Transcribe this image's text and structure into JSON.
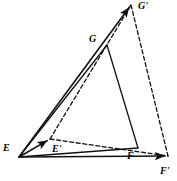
{
  "figure": {
    "background_color": "#ffffff",
    "stroke_color": "#111111",
    "width": 177,
    "height": 181
  },
  "points": {
    "E": {
      "label": "E",
      "x": 19,
      "y": 157,
      "label_x": 3,
      "label_y": 143
    },
    "E_prime": {
      "label": "E'",
      "x": 50,
      "y": 139,
      "label_x": 52,
      "label_y": 144
    },
    "F": {
      "label": "F",
      "x": 138,
      "y": 148,
      "label_x": 127,
      "label_y": 151
    },
    "F_prime": {
      "label": "F'",
      "x": 168,
      "y": 156,
      "label_x": 160,
      "label_y": 166
    },
    "G": {
      "label": "G",
      "x": 107,
      "y": 45,
      "label_x": 89,
      "label_y": 34
    },
    "G_prime": {
      "label": "G'",
      "x": 131,
      "y": 5,
      "label_x": 138,
      "label_y": 1
    }
  },
  "solid_edges": [
    {
      "name": "edge-E-G",
      "from": "E",
      "to": "G"
    },
    {
      "name": "edge-G-F",
      "from": "G",
      "to": "F"
    },
    {
      "name": "edge-E-F",
      "from": "E",
      "to": "F"
    }
  ],
  "dashed_edges": [
    {
      "name": "edge-Eprime-Gprime",
      "from": "E_prime",
      "to": "G_prime"
    },
    {
      "name": "edge-Gprime-Fprime",
      "from": "G_prime",
      "to": "F_prime"
    },
    {
      "name": "edge-Eprime-Fprime",
      "from": "E_prime",
      "to": "F_prime"
    }
  ],
  "vectors": [
    {
      "name": "vector-E-to-Eprime",
      "from": "E",
      "to": "E_prime",
      "style": "solid",
      "arrow": true
    },
    {
      "name": "vector-E-to-Gprime",
      "from": "E",
      "to": "G_prime",
      "style": "solid",
      "arrow": true
    },
    {
      "name": "vector-E-to-Fprime",
      "from": "E",
      "to": "F_prime",
      "style": "solid",
      "arrow": true
    }
  ],
  "style": {
    "line_width": 1.3,
    "vector_line_width": 1.6,
    "dash_pattern": "4,2.6",
    "label_font_size": "10px"
  }
}
